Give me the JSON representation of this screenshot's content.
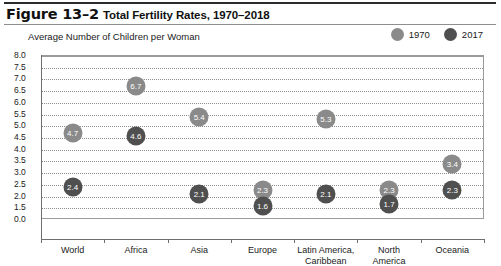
{
  "header": {
    "figure_number": "Figure 13–2",
    "title": "Total Fertility Rates, 1970–2018"
  },
  "chart_data": {
    "type": "scatter",
    "title": "Total Fertility Rates, 1970–2018",
    "ylabel": "Average Number of Children per Woman",
    "xlabel": "",
    "categories": [
      "World",
      "Africa",
      "Asia",
      "Europe",
      "Latin America, Caribbean",
      "North America",
      "Oceania"
    ],
    "category_lines": [
      [
        "World"
      ],
      [
        "Africa"
      ],
      [
        "Asia"
      ],
      [
        "Europe"
      ],
      [
        "Latin America,",
        "Caribbean"
      ],
      [
        "North",
        "America"
      ],
      [
        "Oceania"
      ]
    ],
    "series": [
      {
        "name": "1970",
        "color": "#8a8a8a",
        "values": [
          4.7,
          6.7,
          5.4,
          2.3,
          5.3,
          2.3,
          3.4
        ]
      },
      {
        "name": "2017",
        "color": "#4f4f4f",
        "values": [
          2.4,
          4.6,
          2.1,
          1.6,
          2.1,
          1.7,
          2.3
        ]
      }
    ],
    "ylim": [
      0.0,
      8.0
    ],
    "yticks": [
      "8.0",
      "7.5",
      "7.0",
      "6.5",
      "6.0",
      "5.5",
      "5.0",
      "4.5",
      "4.0",
      "3.5",
      "3.0",
      "2.5",
      "2.0",
      "1.5",
      "0.0"
    ],
    "axis_break_below": 1.5,
    "grid": true,
    "legend_position": "top-right"
  },
  "legend": [
    {
      "label": "1970",
      "color": "#8a8a8a"
    },
    {
      "label": "2017",
      "color": "#4f4f4f"
    }
  ]
}
